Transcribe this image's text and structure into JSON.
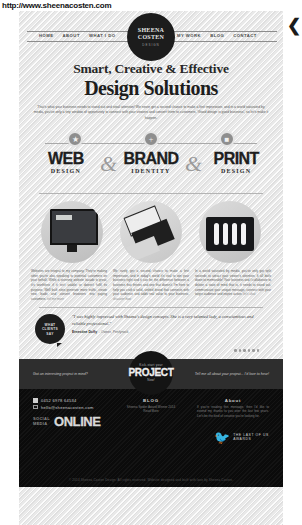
{
  "browser": {
    "url": "http://www.sheenacosten.com"
  },
  "header": {
    "nav_left": [
      "HOME",
      "ABOUT",
      "WHAT I DO"
    ],
    "nav_right": [
      "MY WORK",
      "BLOG",
      "CONTACT"
    ],
    "logo": {
      "line1": "SHEENA",
      "line2": "COSTEN",
      "tagline": "DESIGN"
    },
    "collapse_icon": "chevron-left-icon"
  },
  "hero": {
    "kicker": "Smart, Creative & Effective",
    "title": "Design Solutions",
    "lead": "That's what your business needs to stand out and steal attention! We never get a second chance to make a first impression, and in a world saturated by media, you've only a tiny window of opportunity to connect with your viewers and convert them to customers. 'Good design is good business', so let's make it happen."
  },
  "services": {
    "badges": [
      "web-icon",
      "plus-icon",
      "print-icon"
    ],
    "items": [
      {
        "title": "WEB",
        "subtitle": "DESIGN"
      },
      {
        "title": "BRAND",
        "subtitle": "IDENTITY"
      },
      {
        "title": "PRINT",
        "subtitle": "DESIGN"
      }
    ],
    "ampersand": "&"
  },
  "portfolio": {
    "images": [
      "website-mockup-image",
      "business-cards-image",
      "cutlery-packaging-image"
    ],
    "columns": [
      {
        "text": "Websites are integral to my company. They're making other you're also speaking to potential customers on your behalf. While a stunning website facade is great, it's worthless if it isn't usable or doesn't fulfil its purpose. Well built sites generate more traffic, create new leads and convert browsers into paying customers.",
        "more": "tell me more"
      },
      {
        "text": "We rarely get a second chance to make a first impression, and in today's world it's vital to win your business right and it can be the difference between a business that thrives and one that doesn't. I'm here to help you craft a solid, unified brand that connects with your audience and adds real value to your business.",
        "more": "discover how"
      },
      {
        "text": "In a world saturated by media, you've only got split seconds to attract your viewer's attention. It all boils down to memorable! Your business and I collaborate to deliver a state of mind that is, it needs to stand out, communicate your unique message, connect with your target audience and inspire action.",
        "more": "let's chat"
      }
    ]
  },
  "testimonial": {
    "badge": [
      "WHAT",
      "CLIENTS",
      "SAY"
    ],
    "quote": "\"I was highly impressed with Sheena's design concepts. She is a very talented lady, a conscientious and reliable professional.\"",
    "author": "Ernestine Duffy",
    "role": "Owner, Penfynock",
    "dots": 6
  },
  "cta": {
    "left_text": "Got an interesting project in mind?",
    "right_text": "Tell me all about your project... I'd love to hear!",
    "badge": {
      "top": "Kick-start your",
      "main": "PROJECT",
      "bottom": "Now!"
    }
  },
  "footer": {
    "contact": {
      "phone": "0452 6978 64534",
      "email": "hello@sheenacosten.com",
      "phone_icon": "phone-icon",
      "mail_icon": "mail-icon"
    },
    "social": {
      "label_line1": "SOCIAL",
      "label_line2": "MEDIA",
      "big": "ONLINE"
    },
    "blog": {
      "heading": "BLOG",
      "text": "Sheena Spider Award Winner 2014",
      "more": "Read More"
    },
    "about": {
      "heading": "About",
      "text": "If you're reading this message, then I'd like to extend my thanks to you over the last few years. Let's be the kind of creative you're looking for."
    },
    "award": {
      "icon": "bird-logo-icon",
      "line1": "THE LAST OF US",
      "line2": "AWARDS"
    },
    "copyright": "© 2014 Sheena Costen Design. All rights reserved. Website designed and built with love by Sheena Costen."
  }
}
